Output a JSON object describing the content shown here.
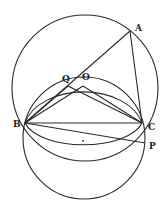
{
  "diagram": {
    "points": {
      "A": {
        "label": "A",
        "x": 130,
        "y": 31,
        "lx": 135,
        "ly": 31
      },
      "Q": {
        "label": "Q",
        "x": 68,
        "y": 86,
        "lx": 62,
        "ly": 81
      },
      "O": {
        "label": "O",
        "x": 83,
        "y": 84,
        "lx": 82,
        "ly": 79
      },
      "B": {
        "label": "B",
        "x": 25,
        "y": 123,
        "lx": 13,
        "ly": 127
      },
      "C": {
        "label": "C",
        "x": 142,
        "y": 123,
        "lx": 148,
        "ly": 130
      },
      "P": {
        "label": "P",
        "x": 145,
        "y": 143,
        "lx": 149,
        "ly": 149
      }
    },
    "circles": [
      {
        "name": "circumcircle-ABC",
        "cx": 85,
        "cy": 88,
        "r": 73
      },
      {
        "name": "circle-BOC",
        "cx": 84,
        "cy": 117,
        "r": 35
      },
      {
        "name": "circle-BC-lower",
        "cx": 84,
        "cy": 140,
        "r": 61
      }
    ],
    "center_dot": {
      "x": 83,
      "y": 141
    },
    "segments": [
      [
        "A",
        "B"
      ],
      [
        "A",
        "C"
      ],
      [
        "B",
        "C"
      ],
      [
        "B",
        "P"
      ],
      [
        "B",
        "O"
      ],
      [
        "O",
        "C"
      ],
      [
        "Q",
        "C"
      ],
      [
        "B",
        "Q"
      ]
    ]
  }
}
